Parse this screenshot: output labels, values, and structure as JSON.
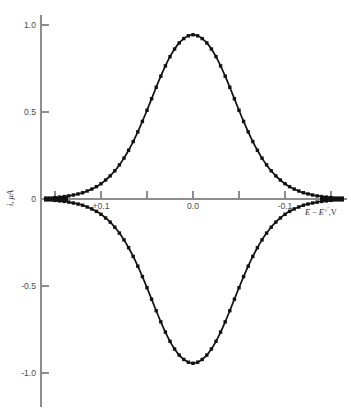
{
  "figure": {
    "background_color": "#ffffff",
    "curve_color": "#111111",
    "axis_color": "#8d8d8d",
    "ylabel_text": "i, μA",
    "xlabel_parts": {
      "e1": "E",
      "minus": "−",
      "e2": "E",
      "standard": "○",
      "prime": "′",
      "comma_v": ",V"
    }
  },
  "chart_data": {
    "type": "line",
    "title": "",
    "subtitle": "",
    "xlabel": "E − E○′, V",
    "ylabel": "i, μA",
    "xlim": [
      0.17,
      -0.17
    ],
    "ylim": [
      -1.25,
      1.15
    ],
    "x_axis_inverted": true,
    "grid": false,
    "legend": null,
    "xticks": [
      0.15,
      0.1,
      0.05,
      0.0,
      -0.05,
      -0.1,
      -0.15
    ],
    "xtick_labels": [
      "",
      "+0.1",
      "",
      "0.0",
      "",
      "-0.1",
      ""
    ],
    "yticks": [
      1.0,
      0.5,
      0.0,
      -0.5,
      -1.0
    ],
    "ytick_labels": [
      "1.0",
      "0.5",
      "0",
      "-0.5",
      "-1.0"
    ],
    "markers": "filled-square",
    "annotations": [],
    "series": [
      {
        "name": "anodic (forward) wave",
        "x": [
          0.16,
          0.15,
          0.145,
          0.14,
          0.135,
          0.13,
          0.125,
          0.12,
          0.115,
          0.11,
          0.105,
          0.1,
          0.095,
          0.09,
          0.085,
          0.08,
          0.075,
          0.07,
          0.065,
          0.06,
          0.055,
          0.05,
          0.045,
          0.04,
          0.035,
          0.03,
          0.025,
          0.02,
          0.015,
          0.01,
          0.005,
          0.0,
          -0.005,
          -0.01,
          -0.015,
          -0.02,
          -0.025,
          -0.03,
          -0.035,
          -0.04,
          -0.045,
          -0.05,
          -0.055,
          -0.06,
          -0.065,
          -0.07,
          -0.075,
          -0.08,
          -0.085,
          -0.09,
          -0.095,
          -0.1,
          -0.105,
          -0.11,
          -0.115,
          -0.12,
          -0.125,
          -0.13,
          -0.135,
          -0.14,
          -0.145,
          -0.15,
          -0.16
        ],
        "y": [
          0.005,
          0.008,
          0.011,
          0.014,
          0.018,
          0.023,
          0.029,
          0.036,
          0.046,
          0.057,
          0.071,
          0.088,
          0.109,
          0.133,
          0.162,
          0.196,
          0.235,
          0.28,
          0.33,
          0.386,
          0.446,
          0.51,
          0.576,
          0.642,
          0.706,
          0.765,
          0.818,
          0.862,
          0.897,
          0.922,
          0.938,
          0.944,
          0.938,
          0.922,
          0.897,
          0.862,
          0.818,
          0.765,
          0.706,
          0.642,
          0.576,
          0.51,
          0.446,
          0.386,
          0.33,
          0.28,
          0.235,
          0.196,
          0.162,
          0.133,
          0.109,
          0.088,
          0.071,
          0.057,
          0.046,
          0.036,
          0.029,
          0.023,
          0.018,
          0.014,
          0.011,
          0.008,
          0.005
        ]
      },
      {
        "name": "cathodic (reverse) wave",
        "x": [
          0.16,
          0.15,
          0.145,
          0.14,
          0.135,
          0.13,
          0.125,
          0.12,
          0.115,
          0.11,
          0.105,
          0.1,
          0.095,
          0.09,
          0.085,
          0.08,
          0.075,
          0.07,
          0.065,
          0.06,
          0.055,
          0.05,
          0.045,
          0.04,
          0.035,
          0.03,
          0.025,
          0.02,
          0.015,
          0.01,
          0.005,
          0.0,
          -0.005,
          -0.01,
          -0.015,
          -0.02,
          -0.025,
          -0.03,
          -0.035,
          -0.04,
          -0.045,
          -0.05,
          -0.055,
          -0.06,
          -0.065,
          -0.07,
          -0.075,
          -0.08,
          -0.085,
          -0.09,
          -0.095,
          -0.1,
          -0.105,
          -0.11,
          -0.115,
          -0.12,
          -0.125,
          -0.13,
          -0.135,
          -0.14,
          -0.145,
          -0.15,
          -0.16
        ],
        "y": [
          -0.005,
          -0.008,
          -0.011,
          -0.014,
          -0.018,
          -0.023,
          -0.029,
          -0.036,
          -0.046,
          -0.057,
          -0.071,
          -0.088,
          -0.109,
          -0.133,
          -0.162,
          -0.196,
          -0.235,
          -0.28,
          -0.33,
          -0.386,
          -0.446,
          -0.51,
          -0.576,
          -0.642,
          -0.706,
          -0.765,
          -0.818,
          -0.862,
          -0.897,
          -0.922,
          -0.938,
          -0.944,
          -0.938,
          -0.922,
          -0.897,
          -0.862,
          -0.818,
          -0.765,
          -0.706,
          -0.642,
          -0.576,
          -0.51,
          -0.446,
          -0.386,
          -0.33,
          -0.28,
          -0.235,
          -0.196,
          -0.162,
          -0.133,
          -0.109,
          -0.088,
          -0.071,
          -0.057,
          -0.046,
          -0.036,
          -0.029,
          -0.023,
          -0.018,
          -0.014,
          -0.011,
          -0.008,
          -0.005
        ]
      }
    ],
    "marker_x": [
      0.15,
      0.145,
      0.14,
      0.135,
      0.13,
      0.125,
      0.12,
      0.115,
      0.11,
      0.105,
      0.1,
      0.095,
      0.09,
      0.085,
      0.08,
      0.075,
      0.07,
      0.065,
      0.06,
      0.055,
      0.05,
      0.045,
      0.04,
      0.035,
      0.03,
      0.025,
      0.02,
      0.015,
      0.01,
      0.005,
      0.0,
      -0.005,
      -0.01,
      -0.015,
      -0.02,
      -0.025,
      -0.03,
      -0.035,
      -0.04,
      -0.045,
      -0.05,
      -0.055,
      -0.06,
      -0.065,
      -0.07,
      -0.075,
      -0.08,
      -0.085,
      -0.09,
      -0.095,
      -0.1,
      -0.105,
      -0.11,
      -0.115,
      -0.12,
      -0.125,
      -0.13,
      -0.135,
      -0.14,
      -0.145,
      -0.15
    ],
    "peak_anodic": {
      "x": 0.0,
      "y": 0.944
    },
    "peak_cathodic": {
      "x": 0.0,
      "y": -0.944
    }
  }
}
